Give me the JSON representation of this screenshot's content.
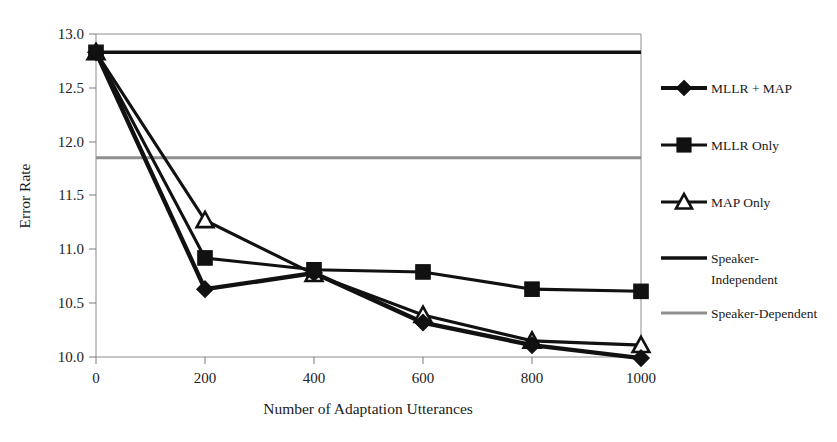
{
  "chart_data": {
    "type": "line",
    "title": "",
    "xlabel": "Number of Adaptation Utterances",
    "ylabel": "Error Rate",
    "x": [
      0,
      200,
      400,
      600,
      800,
      1000
    ],
    "xtick_labels": [
      "0",
      "200",
      "400",
      "600",
      "800",
      "1000"
    ],
    "ytick_labels": [
      "10.0",
      "10.5",
      "11.0",
      "11.5",
      "12.0",
      "12.5",
      "13.0"
    ],
    "ytick_values": [
      10.0,
      10.5,
      11.0,
      11.5,
      12.0,
      12.5,
      13.0
    ],
    "xlim": [
      0,
      1000
    ],
    "ylim": [
      10.0,
      13.0
    ],
    "grid": false,
    "legend_position": "right",
    "series": [
      {
        "name": "MLLR + MAP",
        "marker": "diamond",
        "marker_style": "filled",
        "line_weight": "thick",
        "color": "#111111",
        "values": [
          12.83,
          10.63,
          10.78,
          10.32,
          10.11,
          9.99
        ]
      },
      {
        "name": "MLLR Only",
        "marker": "square",
        "marker_style": "filled",
        "line_weight": "normal",
        "color": "#111111",
        "values": [
          12.83,
          10.92,
          10.81,
          10.79,
          10.63,
          10.61
        ]
      },
      {
        "name": "MAP Only",
        "marker": "triangle",
        "marker_style": "open",
        "line_weight": "normal",
        "color": "#111111",
        "values": [
          12.83,
          11.27,
          10.77,
          10.39,
          10.15,
          10.11
        ]
      }
    ],
    "reference_lines": [
      {
        "name": "Speaker-Independent",
        "value": 12.83,
        "color": "#111111",
        "style": "solid-dark"
      },
      {
        "name": "Speaker-Dependent",
        "value": 11.85,
        "color": "#8f8f8f",
        "style": "solid-gray"
      }
    ]
  },
  "legend": {
    "entries": [
      {
        "label": "MLLR + MAP",
        "line1": "MLLR + MAP",
        "line2": ""
      },
      {
        "label": "MLLR Only",
        "line1": "MLLR Only",
        "line2": ""
      },
      {
        "label": "MAP Only",
        "line1": "MAP Only",
        "line2": ""
      },
      {
        "label": "Speaker-Independent",
        "line1": "Speaker-",
        "line2": "Independent"
      },
      {
        "label": "Speaker-Dependent",
        "line1": "Speaker-Dependent",
        "line2": ""
      }
    ]
  }
}
